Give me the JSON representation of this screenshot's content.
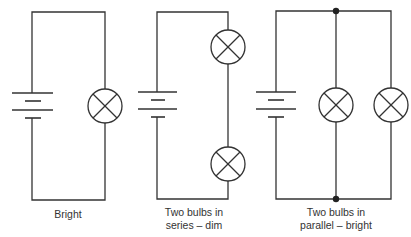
{
  "colors": {
    "line": "#333333",
    "text": "#333333",
    "background": "#ffffff"
  },
  "circuits": [
    {
      "id": "single-bulb",
      "label_lines": [
        "Bright"
      ],
      "components": {
        "battery": 1,
        "bulbs": 1
      },
      "configuration": "single"
    },
    {
      "id": "series",
      "label_lines": [
        "Two bulbs in",
        "series – dim"
      ],
      "components": {
        "battery": 1,
        "bulbs": 2
      },
      "configuration": "series"
    },
    {
      "id": "parallel",
      "label_lines": [
        "Two bulbs in",
        "parallel – bright"
      ],
      "components": {
        "battery": 1,
        "bulbs": 2,
        "junction_nodes": 2
      },
      "configuration": "parallel"
    }
  ],
  "icons": {
    "battery": "battery-cell-symbol",
    "bulb": "lamp-symbol",
    "junction": "junction-dot"
  }
}
